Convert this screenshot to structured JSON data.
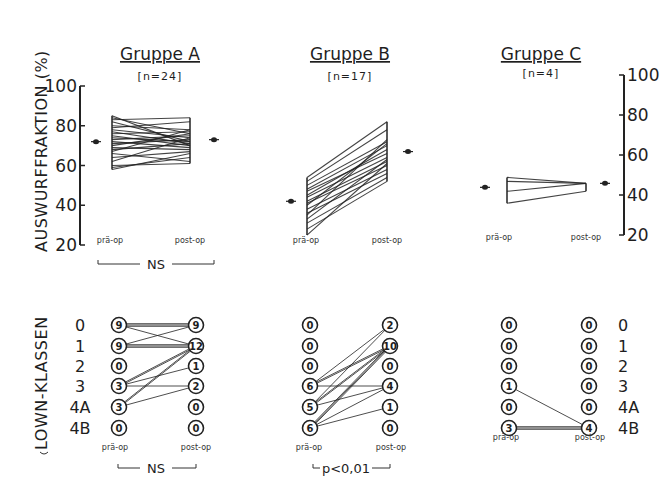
{
  "chart_data": [
    {
      "type": "line",
      "panel": "Auswurffraktion",
      "ylabel": "AUSWURFFRAKTION (%)",
      "ylim": [
        20,
        100
      ],
      "yticks": [
        20,
        40,
        60,
        80,
        100
      ],
      "x_categories": [
        "prä-op",
        "post-op"
      ],
      "groups": [
        {
          "title": "Gruppe A",
          "n_label": "[n=24]",
          "n": 24,
          "mean_pre": 72,
          "mean_post": 73,
          "pairs": [
            [
              85,
              70
            ],
            [
              84,
              76
            ],
            [
              83,
              84
            ],
            [
              82,
              72
            ],
            [
              80,
              78
            ],
            [
              79,
              82
            ],
            [
              78,
              74
            ],
            [
              77,
              71
            ],
            [
              76,
              77
            ],
            [
              75,
              70
            ],
            [
              74,
              72
            ],
            [
              73,
              75
            ],
            [
              72,
              69
            ],
            [
              71,
              73
            ],
            [
              70,
              76
            ],
            [
              69,
              68
            ],
            [
              68,
              71
            ],
            [
              67,
              78
            ],
            [
              66,
              62
            ],
            [
              64,
              67
            ],
            [
              62,
              74
            ],
            [
              60,
              61
            ],
            [
              59,
              64
            ],
            [
              58,
              66
            ]
          ],
          "significance": "NS"
        },
        {
          "title": "Gruppe B",
          "n_label": "[n=17]",
          "n": 17,
          "mean_pre": 42,
          "mean_post": 67,
          "pairs": [
            [
              54,
              82
            ],
            [
              52,
              78
            ],
            [
              50,
              72
            ],
            [
              48,
              70
            ],
            [
              47,
              66
            ],
            [
              45,
              68
            ],
            [
              44,
              64
            ],
            [
              42,
              62
            ],
            [
              41,
              60
            ],
            [
              40,
              71
            ],
            [
              38,
              58
            ],
            [
              36,
              56
            ],
            [
              35,
              73
            ],
            [
              33,
              63
            ],
            [
              31,
              54
            ],
            [
              28,
              52
            ],
            [
              25,
              61
            ]
          ],
          "significance": "p<0,01"
        },
        {
          "title": "Gruppe C",
          "n_label": "[n=4]",
          "n": 4,
          "mean_pre": 47,
          "mean_post": 49,
          "pairs": [
            [
              52,
              49
            ],
            [
              50,
              49
            ],
            [
              45,
              49
            ],
            [
              39,
              45
            ]
          ],
          "significance": ""
        }
      ]
    },
    {
      "type": "table",
      "panel": "Lown-Klassen",
      "ylabel": "LOWN-KLASSEN",
      "classes": [
        "0",
        "1",
        "2",
        "3",
        "4A",
        "4B"
      ],
      "x_categories": [
        "prä-op",
        "post-op"
      ],
      "groups": [
        {
          "title": "Gruppe A",
          "pre": [
            9,
            9,
            0,
            3,
            3,
            0
          ],
          "post": [
            9,
            12,
            1,
            2,
            0,
            0
          ],
          "significance": "NS"
        },
        {
          "title": "Gruppe B",
          "pre": [
            0,
            0,
            0,
            6,
            5,
            6
          ],
          "post": [
            2,
            10,
            0,
            4,
            1,
            0
          ],
          "significance": "p<0,01"
        },
        {
          "title": "Gruppe C",
          "pre": [
            0,
            0,
            0,
            1,
            0,
            3
          ],
          "post": [
            0,
            0,
            0,
            0,
            0,
            4
          ],
          "significance": ""
        }
      ]
    }
  ],
  "labels": {
    "ef_axis": "AUSWURFFRAKTION (%)",
    "lown_axis": "LOWN-KLASSEN",
    "pre": "prä-op",
    "post": "post-op",
    "groupA": "Gruppe A",
    "groupB": "Gruppe B",
    "groupC": "Gruppe C",
    "nA": "[n=24]",
    "nB": "[n=17]",
    "nC": "[n=4]",
    "sigA_ef": "NS",
    "sigA_lown": "NS",
    "sigB_lown": "p<0,01"
  }
}
